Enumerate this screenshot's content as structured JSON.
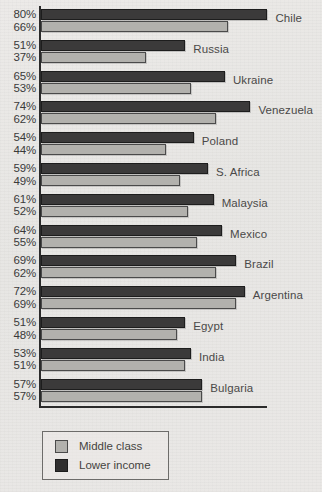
{
  "chart_data": {
    "type": "bar",
    "orientation": "horizontal",
    "title": "",
    "xlabel": "",
    "ylabel": "",
    "xlim": [
      0,
      80
    ],
    "grid": false,
    "legend_position": "bottom-left",
    "value_suffix": "%",
    "categories": [
      "Chile",
      "Russia",
      "Ukraine",
      "Venezuela",
      "Poland",
      "S. Africa",
      "Malaysia",
      "Mexico",
      "Brazil",
      "Argentina",
      "Egypt",
      "India",
      "Bulgaria"
    ],
    "series": [
      {
        "name": "Lower income",
        "color": "#3b3a3a",
        "values": [
          80,
          51,
          65,
          74,
          54,
          59,
          61,
          64,
          69,
          72,
          51,
          53,
          57
        ],
        "labels": [
          "80%",
          "51%",
          "65%",
          "74%",
          "54%",
          "59%",
          "61%",
          "64%",
          "69%",
          "72%",
          "51%",
          "53%",
          "57%"
        ]
      },
      {
        "name": "Middle class",
        "color": "#b2b1ad",
        "values": [
          66,
          37,
          53,
          62,
          44,
          49,
          52,
          55,
          62,
          69,
          48,
          51,
          57
        ],
        "labels": [
          "66%",
          "37%",
          "53%",
          "62%",
          "44%",
          "49%",
          "52%",
          "55%",
          "62%",
          "69%",
          "48%",
          "51%",
          "57%"
        ]
      }
    ]
  },
  "legend": {
    "items": [
      {
        "label": "Middle class",
        "color": "#b2b1ad"
      },
      {
        "label": "Lower income",
        "color": "#3b3a3a"
      }
    ]
  }
}
